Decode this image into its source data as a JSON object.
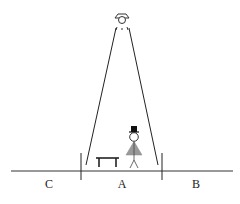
{
  "diagram": {
    "labels": {
      "left": "C",
      "center": "A",
      "right": "B"
    },
    "elements": [
      "ceiling-lamp",
      "light-beam",
      "floor-line",
      "boundary-ticks",
      "bench",
      "person-with-top-hat"
    ],
    "colors": {
      "line": "#222222",
      "dress": "#999999",
      "background": "#ffffff"
    }
  }
}
